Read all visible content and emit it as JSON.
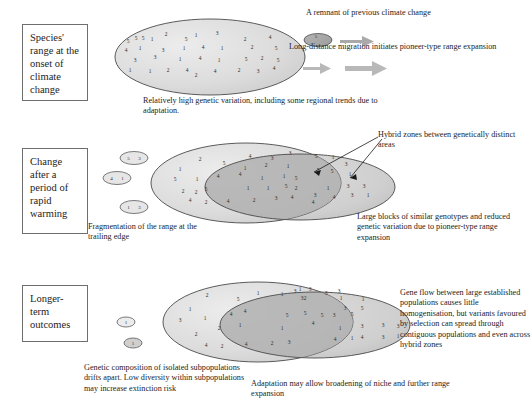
{
  "figure": {
    "type": "conceptual-diagram",
    "stages": [
      {
        "id": "stage-1",
        "label": "Species' range at the onset of climate change",
        "box": {
          "x": 22,
          "y": 24,
          "w": 66,
          "h": 77
        },
        "caption": "Relatively high genetic variation, including some regional trends due to adaptation.",
        "caption_pos": {
          "x": 143,
          "y": 96,
          "w": 260
        },
        "annotations": [
          {
            "id": "remnant",
            "text": "A remnant of previous climate change",
            "x": 306,
            "y": 8,
            "w": 220
          },
          {
            "id": "pioneer",
            "text": "Long-distance migration initiates pioneer-type range expansion",
            "x": 289,
            "y": 42,
            "w": 245
          }
        ]
      },
      {
        "id": "stage-2",
        "label": "Change after a period of rapid warming",
        "box": {
          "x": 22,
          "y": 148,
          "w": 66,
          "h": 86
        },
        "caption": "Fragmentation of the range at the trailing edge",
        "caption_pos": {
          "x": 88,
          "y": 222,
          "w": 120
        },
        "annotations": [
          {
            "id": "hybrid-zones",
            "text": "Hybrid zones between genetically distinct areas",
            "x": 378,
            "y": 130,
            "w": 150
          },
          {
            "id": "large-blocks",
            "text": "Large blocks of similar genotypes and reduced genetic variation due to pioneer-type range expansion",
            "x": 357,
            "y": 212,
            "w": 175
          }
        ]
      },
      {
        "id": "stage-3",
        "label": "Longer-term outcomes",
        "box": {
          "x": 22,
          "y": 285,
          "w": 66,
          "h": 57
        },
        "caption": "Genetic composition of isolated subpopulations drifts apart.  Low diversity within subpopulations may increase extinction risk",
        "caption_pos": {
          "x": 84,
          "y": 363,
          "w": 170
        },
        "annotations": [
          {
            "id": "gene-flow",
            "text": "Gene flow between large established populations causes little homogenisation, but variants favoured by selection can spread through contiguous populations and even across hybrid zones",
            "x": 400,
            "y": 288,
            "w": 132
          },
          {
            "id": "adaptation",
            "text": "Adaptation may allow broadening of niche and further range expansion",
            "x": 251,
            "y": 379,
            "w": 220
          }
        ]
      }
    ],
    "colors": {
      "range_light": "#d9d9d9",
      "range_mid": "#c4c4c4",
      "range_dark": "#a8a8a8",
      "outline": "#4a4a4a",
      "arrow_grey": "#a9a9a9",
      "text": "#1d1d1d",
      "box_border": "#6e6e6e"
    },
    "gene_numbers": {
      "stage1_main": [
        {
          "x": 128,
          "y": 43,
          "v": "5"
        },
        {
          "x": 136,
          "y": 40,
          "v": "5"
        },
        {
          "x": 143,
          "y": 40,
          "v": "5"
        },
        {
          "x": 152,
          "y": 41,
          "v": "1"
        },
        {
          "x": 166,
          "y": 36,
          "v": "2"
        },
        {
          "x": 186,
          "y": 41,
          "v": "5"
        },
        {
          "x": 196,
          "y": 37,
          "v": "1"
        },
        {
          "x": 217,
          "y": 35,
          "v": "3"
        },
        {
          "x": 245,
          "y": 41,
          "v": "2"
        },
        {
          "x": 270,
          "y": 39,
          "v": "4"
        },
        {
          "x": 126,
          "y": 52,
          "v": "4"
        },
        {
          "x": 140,
          "y": 50,
          "v": "1"
        },
        {
          "x": 163,
          "y": 52,
          "v": "3"
        },
        {
          "x": 184,
          "y": 50,
          "v": "1"
        },
        {
          "x": 203,
          "y": 49,
          "v": "4"
        },
        {
          "x": 222,
          "y": 50,
          "v": "1"
        },
        {
          "x": 252,
          "y": 49,
          "v": "2"
        },
        {
          "x": 276,
          "y": 50,
          "v": "5"
        },
        {
          "x": 135,
          "y": 62,
          "v": "3"
        },
        {
          "x": 155,
          "y": 59,
          "v": "3"
        },
        {
          "x": 180,
          "y": 61,
          "v": "1"
        },
        {
          "x": 200,
          "y": 60,
          "v": "4"
        },
        {
          "x": 219,
          "y": 62,
          "v": "1"
        },
        {
          "x": 246,
          "y": 61,
          "v": "5"
        },
        {
          "x": 262,
          "y": 60,
          "v": "2"
        },
        {
          "x": 278,
          "y": 62,
          "v": "5"
        },
        {
          "x": 130,
          "y": 72,
          "v": "1"
        },
        {
          "x": 150,
          "y": 73,
          "v": "1"
        },
        {
          "x": 168,
          "y": 72,
          "v": "2"
        },
        {
          "x": 187,
          "y": 72,
          "v": "4"
        },
        {
          "x": 196,
          "y": 77,
          "v": "2"
        },
        {
          "x": 215,
          "y": 73,
          "v": "4"
        },
        {
          "x": 239,
          "y": 72,
          "v": "2"
        },
        {
          "x": 258,
          "y": 73,
          "v": "3"
        },
        {
          "x": 274,
          "y": 70,
          "v": "4"
        }
      ],
      "stage1_remnant": [
        {
          "x": 316,
          "y": 38,
          "v": "5"
        }
      ],
      "stage2_frag": [
        {
          "cx": 134,
          "cy": 158,
          "vals": [
            "5",
            "3"
          ]
        },
        {
          "cx": 117,
          "cy": 178,
          "vals": [
            "4",
            "1"
          ]
        },
        {
          "cx": 134,
          "cy": 207,
          "vals": [
            "1",
            "3"
          ]
        }
      ],
      "stage2_main": [
        {
          "x": 200,
          "y": 161,
          "v": "2"
        },
        {
          "x": 224,
          "y": 165,
          "v": "5"
        },
        {
          "x": 250,
          "y": 158,
          "v": "4"
        },
        {
          "x": 272,
          "y": 160,
          "v": "3"
        },
        {
          "x": 290,
          "y": 155,
          "v": "3"
        },
        {
          "x": 180,
          "y": 171,
          "v": "1"
        },
        {
          "x": 245,
          "y": 170,
          "v": "1"
        },
        {
          "x": 266,
          "y": 167,
          "v": "2"
        },
        {
          "x": 288,
          "y": 168,
          "v": "1"
        },
        {
          "x": 175,
          "y": 181,
          "v": "5"
        },
        {
          "x": 197,
          "y": 181,
          "v": "1"
        },
        {
          "x": 218,
          "y": 178,
          "v": "4"
        },
        {
          "x": 240,
          "y": 176,
          "v": "4"
        },
        {
          "x": 262,
          "y": 180,
          "v": "1"
        },
        {
          "x": 284,
          "y": 178,
          "v": "1"
        },
        {
          "x": 296,
          "y": 180,
          "v": "5"
        },
        {
          "x": 183,
          "y": 193,
          "v": "2"
        },
        {
          "x": 196,
          "y": 194,
          "v": "2"
        },
        {
          "x": 206,
          "y": 191,
          "v": "5"
        },
        {
          "x": 248,
          "y": 190,
          "v": "1"
        },
        {
          "x": 268,
          "y": 190,
          "v": "1"
        },
        {
          "x": 286,
          "y": 188,
          "v": "5"
        },
        {
          "x": 296,
          "y": 190,
          "v": "2"
        },
        {
          "x": 190,
          "y": 202,
          "v": "4"
        },
        {
          "x": 206,
          "y": 204,
          "v": "2"
        },
        {
          "x": 228,
          "y": 203,
          "v": "4"
        },
        {
          "x": 254,
          "y": 202,
          "v": "2"
        },
        {
          "x": 276,
          "y": 200,
          "v": "3"
        },
        {
          "x": 292,
          "y": 199,
          "v": "4"
        }
      ],
      "stage2_overlap": [
        {
          "x": 316,
          "y": 158,
          "v": "5"
        },
        {
          "x": 333,
          "y": 159,
          "v": "1"
        },
        {
          "x": 346,
          "y": 166,
          "v": "3"
        },
        {
          "x": 318,
          "y": 172,
          "v": "5"
        },
        {
          "x": 332,
          "y": 173,
          "v": "5"
        },
        {
          "x": 350,
          "y": 176,
          "v": "1"
        }
      ],
      "stage2_pioneer": [
        {
          "x": 328,
          "y": 190,
          "v": "1"
        },
        {
          "x": 348,
          "y": 188,
          "v": "3"
        },
        {
          "x": 364,
          "y": 188,
          "v": "3"
        },
        {
          "x": 315,
          "y": 197,
          "v": "3"
        },
        {
          "x": 334,
          "y": 199,
          "v": "4"
        },
        {
          "x": 352,
          "y": 197,
          "v": "3"
        },
        {
          "x": 368,
          "y": 197,
          "v": "1"
        },
        {
          "x": 313,
          "y": 204,
          "v": "4"
        }
      ],
      "stage3_isolated": [
        {
          "cx": 126,
          "cy": 322,
          "vals": [
            "1"
          ]
        },
        {
          "cx": 133,
          "cy": 343,
          "vals": [
            "1"
          ]
        }
      ],
      "stage3_main": [
        {
          "x": 207,
          "y": 297,
          "v": "2"
        },
        {
          "x": 238,
          "y": 301,
          "v": "5"
        },
        {
          "x": 258,
          "y": 295,
          "v": "1"
        },
        {
          "x": 282,
          "y": 296,
          "v": "1"
        },
        {
          "x": 295,
          "y": 293,
          "v": "3"
        },
        {
          "x": 305,
          "y": 300,
          "v": "2"
        },
        {
          "x": 326,
          "y": 295,
          "v": "3"
        },
        {
          "x": 190,
          "y": 311,
          "v": "1"
        },
        {
          "x": 180,
          "y": 322,
          "v": "3"
        },
        {
          "x": 205,
          "y": 320,
          "v": "1"
        },
        {
          "x": 231,
          "y": 316,
          "v": "4"
        },
        {
          "x": 245,
          "y": 313,
          "v": "4"
        },
        {
          "x": 287,
          "y": 317,
          "v": "5"
        },
        {
          "x": 305,
          "y": 315,
          "v": "5"
        },
        {
          "x": 322,
          "y": 317,
          "v": "5"
        },
        {
          "x": 240,
          "y": 327,
          "v": "1"
        },
        {
          "x": 219,
          "y": 330,
          "v": "2"
        },
        {
          "x": 196,
          "y": 336,
          "v": "2"
        },
        {
          "x": 282,
          "y": 330,
          "v": "1"
        },
        {
          "x": 313,
          "y": 325,
          "v": "4"
        },
        {
          "x": 206,
          "y": 347,
          "v": "4"
        },
        {
          "x": 222,
          "y": 348,
          "v": "2"
        },
        {
          "x": 246,
          "y": 346,
          "v": "4"
        },
        {
          "x": 272,
          "y": 345,
          "v": "2"
        },
        {
          "x": 289,
          "y": 344,
          "v": "3"
        }
      ],
      "stage3_overlap": [
        {
          "x": 300,
          "y": 291,
          "v": "1"
        },
        {
          "x": 310,
          "y": 291,
          "v": "3"
        },
        {
          "x": 339,
          "y": 293,
          "v": "3"
        },
        {
          "x": 302,
          "y": 300,
          "v": "3"
        },
        {
          "x": 341,
          "y": 300,
          "v": "1"
        },
        {
          "x": 363,
          "y": 301,
          "v": "1"
        },
        {
          "x": 345,
          "y": 310,
          "v": "3"
        },
        {
          "x": 362,
          "y": 310,
          "v": "5"
        },
        {
          "x": 334,
          "y": 317,
          "v": "3"
        },
        {
          "x": 352,
          "y": 316,
          "v": "5"
        }
      ],
      "stage3_pioneer": [
        {
          "x": 340,
          "y": 330,
          "v": "1"
        },
        {
          "x": 362,
          "y": 328,
          "v": "3"
        },
        {
          "x": 383,
          "y": 327,
          "v": "3"
        },
        {
          "x": 398,
          "y": 328,
          "v": "3"
        },
        {
          "x": 335,
          "y": 341,
          "v": "4"
        },
        {
          "x": 352,
          "y": 340,
          "v": "1"
        },
        {
          "x": 362,
          "y": 339,
          "v": "4"
        },
        {
          "x": 383,
          "y": 339,
          "v": "3"
        },
        {
          "x": 398,
          "y": 338,
          "v": "1"
        }
      ]
    }
  }
}
